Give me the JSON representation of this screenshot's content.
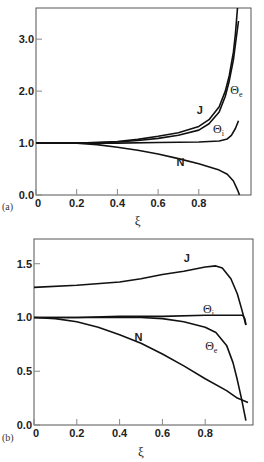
{
  "chart_data": [
    {
      "type": "line",
      "panel_label": "(a)",
      "title": "",
      "xlabel": "ξ",
      "ylabel": "",
      "xlim": [
        0,
        1.0
      ],
      "ylim": [
        0,
        3.6
      ],
      "xticks": [
        0,
        0.2,
        0.4,
        0.6,
        0.8
      ],
      "xtick_labels": [
        "0",
        "0.2",
        "0.4",
        "0.6",
        "0.8"
      ],
      "yticks": [
        0,
        1,
        2,
        3
      ],
      "ytick_labels": [
        "0.0",
        "1.0",
        "2.0",
        "3.0"
      ],
      "grid": false,
      "legend": "inline labels",
      "series": [
        {
          "name": "J",
          "label": "J",
          "label_pos": [
            0.79,
            1.55
          ],
          "x": [
            0,
            0.2,
            0.3,
            0.4,
            0.5,
            0.6,
            0.7,
            0.8,
            0.85,
            0.9,
            0.93,
            0.95,
            0.97,
            0.98,
            0.99
          ],
          "y": [
            1.0,
            1.0,
            1.01,
            1.03,
            1.07,
            1.13,
            1.2,
            1.32,
            1.45,
            1.7,
            2.0,
            2.3,
            2.75,
            3.1,
            3.6
          ]
        },
        {
          "name": "Θe",
          "label": "Θe",
          "label_pos": [
            0.955,
            1.95
          ],
          "x": [
            0,
            0.2,
            0.3,
            0.4,
            0.5,
            0.6,
            0.7,
            0.8,
            0.85,
            0.9,
            0.93,
            0.95,
            0.97,
            0.98,
            0.995
          ],
          "y": [
            1.0,
            1.0,
            1.01,
            1.02,
            1.05,
            1.09,
            1.15,
            1.25,
            1.37,
            1.6,
            1.9,
            2.2,
            2.6,
            2.9,
            3.35
          ]
        },
        {
          "name": "Θi",
          "label": "Θi",
          "label_pos": [
            0.87,
            1.2
          ],
          "x": [
            0,
            0.2,
            0.4,
            0.6,
            0.8,
            0.9,
            0.94,
            0.96,
            0.98,
            0.995
          ],
          "y": [
            1.0,
            1.0,
            1.0,
            1.01,
            1.02,
            1.04,
            1.08,
            1.15,
            1.28,
            1.43
          ]
        },
        {
          "name": "N",
          "label": "N",
          "label_pos": [
            0.69,
            0.55
          ],
          "x": [
            0,
            0.2,
            0.3,
            0.4,
            0.5,
            0.6,
            0.7,
            0.8,
            0.9,
            0.94,
            0.97,
            0.99,
            1.0
          ],
          "y": [
            1.0,
            1.0,
            0.97,
            0.92,
            0.86,
            0.79,
            0.7,
            0.6,
            0.48,
            0.4,
            0.27,
            0.1,
            0.0
          ]
        }
      ]
    },
    {
      "type": "line",
      "panel_label": "(b)",
      "title": "",
      "xlabel": "ξ",
      "ylabel": "",
      "xlim": [
        0,
        1.0
      ],
      "ylim": [
        0,
        1.73
      ],
      "xticks": [
        0,
        0.2,
        0.4,
        0.6,
        0.8
      ],
      "xtick_labels": [
        "0",
        "0.2",
        "0.4",
        "0.6",
        "0.8"
      ],
      "yticks": [
        0,
        0.5,
        1.0,
        1.5
      ],
      "ytick_labels": [
        "0.0",
        "0.5",
        "1.0",
        "1.5"
      ],
      "grid": false,
      "legend": "inline labels",
      "series": [
        {
          "name": "J",
          "label": "J",
          "label_pos": [
            0.7,
            1.52
          ],
          "x": [
            0,
            0.2,
            0.4,
            0.5,
            0.6,
            0.7,
            0.8,
            0.85,
            0.88,
            0.92,
            0.95,
            0.97,
            0.99
          ],
          "y": [
            1.28,
            1.3,
            1.33,
            1.36,
            1.4,
            1.43,
            1.47,
            1.48,
            1.46,
            1.36,
            1.22,
            1.08,
            0.93
          ]
        },
        {
          "name": "Θi",
          "label": "Θi",
          "label_pos": [
            0.79,
            1.04
          ],
          "x": [
            0,
            0.2,
            0.4,
            0.6,
            0.8,
            0.95,
            0.975,
            0.985,
            0.99
          ],
          "y": [
            1.0,
            1.0,
            1.01,
            1.01,
            1.02,
            1.02,
            1.02,
            0.99,
            0.93
          ]
        },
        {
          "name": "Θe",
          "label": "Θe",
          "label_pos": [
            0.8,
            0.7
          ],
          "x": [
            0,
            0.2,
            0.4,
            0.5,
            0.6,
            0.7,
            0.8,
            0.85,
            0.9,
            0.93,
            0.95,
            0.97,
            0.99
          ],
          "y": [
            1.0,
            1.0,
            1.0,
            1.0,
            0.99,
            0.96,
            0.91,
            0.86,
            0.74,
            0.58,
            0.42,
            0.24,
            0.04
          ]
        },
        {
          "name": "N",
          "label": "N",
          "label_pos": [
            0.47,
            0.78
          ],
          "x": [
            0,
            0.1,
            0.2,
            0.3,
            0.4,
            0.5,
            0.6,
            0.7,
            0.8,
            0.9,
            0.95,
            1.0
          ],
          "y": [
            1.0,
            0.99,
            0.96,
            0.91,
            0.84,
            0.76,
            0.66,
            0.55,
            0.43,
            0.32,
            0.25,
            0.21
          ]
        }
      ]
    }
  ]
}
